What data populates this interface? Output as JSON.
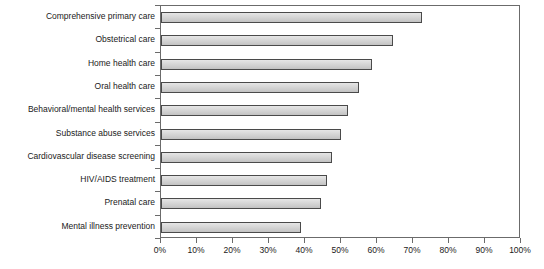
{
  "chart_data": {
    "type": "bar",
    "orientation": "horizontal",
    "title": "",
    "xlabel": "",
    "ylabel": "",
    "xlim": [
      0,
      100
    ],
    "xtick_labels": [
      "0%",
      "10%",
      "20%",
      "30%",
      "40%",
      "50%",
      "60%",
      "70%",
      "80%",
      "90%",
      "100%"
    ],
    "xtick_values": [
      0,
      10,
      20,
      30,
      40,
      50,
      60,
      70,
      80,
      90,
      100
    ],
    "grid": false,
    "legend": false,
    "categories": [
      "Comprehensive primary care",
      "Obstetrical care",
      "Home health care",
      "Oral health care",
      "Behavioral/mental health services",
      "Substance abuse services",
      "Cardiovascular disease screening",
      "HIV/AIDS treatment",
      "Prenatal care",
      "Mental illness prevention"
    ],
    "values": [
      72.5,
      64.5,
      58.5,
      55,
      52,
      50,
      47.5,
      46,
      44.5,
      39
    ],
    "value_unit": "%",
    "bar_fill_color": "#d3d3d3",
    "bar_border_color": "#4a4a4a",
    "axis_color": "#6b6b6b",
    "background_color": "#ffffff"
  }
}
